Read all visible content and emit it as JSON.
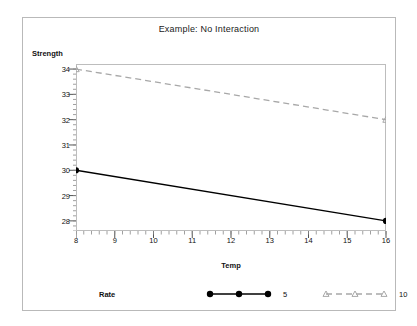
{
  "chart_data": {
    "type": "line",
    "title": "Example:  No Interaction",
    "xlabel": "Temp",
    "ylabel": "Strength",
    "x": [
      8,
      16
    ],
    "xlim": [
      8,
      16
    ],
    "ylim": [
      27.6,
      34.2
    ],
    "xticks": [
      8,
      9,
      10,
      11,
      12,
      13,
      14,
      15,
      16
    ],
    "yticks": [
      28,
      29,
      30,
      31,
      32,
      33,
      34
    ],
    "xtick_labels": [
      "8",
      "9",
      "10",
      "11",
      "12",
      "13",
      "14",
      "15",
      "16"
    ],
    "ytick_labels": [
      "28",
      "29",
      "30",
      "31",
      "32",
      "33",
      "34"
    ],
    "minor_ticks": true,
    "grid": false,
    "legend_position": "bottom",
    "legend_title": "Rate",
    "series": [
      {
        "name": "5",
        "values": [
          30,
          28
        ],
        "color": "#000000",
        "linestyle": "solid",
        "marker": "filled-circle"
      },
      {
        "name": "10",
        "values": [
          34,
          32
        ],
        "color": "#a8a8a8",
        "linestyle": "dashed",
        "marker": "open-triangle"
      }
    ]
  },
  "colors": {
    "frame": "#bdbdbd",
    "outer_frame": "#b9b9b9",
    "series_5": "#000000",
    "series_10": "#a8a8a8",
    "text": "#111111"
  }
}
